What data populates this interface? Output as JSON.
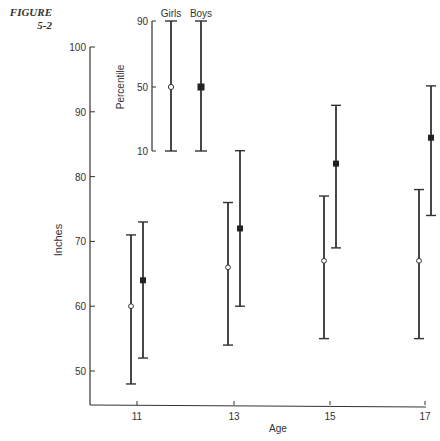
{
  "figure": {
    "label_line1": "FIGURE",
    "label_line2": "5-2"
  },
  "chart_data": {
    "type": "error-bar",
    "title": "",
    "xlabel": "Age",
    "ylabel": "Inches",
    "categories": [
      "11",
      "13",
      "15",
      "17"
    ],
    "ylim": [
      45,
      100
    ],
    "yticks": [
      50,
      60,
      70,
      80,
      90,
      100
    ],
    "series": [
      {
        "name": "Girls",
        "marker": "open-circle",
        "p10": [
          48,
          54,
          55,
          55
        ],
        "p50": [
          60,
          66,
          67,
          67
        ],
        "p90": [
          71,
          76,
          77,
          78
        ]
      },
      {
        "name": "Boys",
        "marker": "filled-square",
        "p10": [
          52,
          60,
          69,
          74
        ],
        "p50": [
          64,
          72,
          82,
          86
        ],
        "p90": [
          73,
          84,
          91,
          94
        ]
      }
    ],
    "legend": {
      "axis_label": "Percentile",
      "ticks": [
        "90",
        "50",
        "10"
      ],
      "entries": [
        "Girls",
        "Boys"
      ],
      "position": "top-inset"
    },
    "grid": false
  }
}
